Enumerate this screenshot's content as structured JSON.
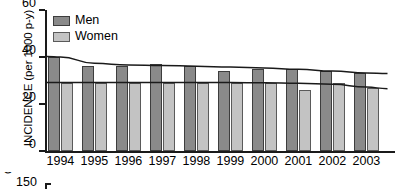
{
  "chart_data": {
    "type": "bar",
    "title": "",
    "xlabel": "",
    "ylabel": "INCIDENCE (per 1000 p-y)",
    "ylim": [
      0,
      60
    ],
    "yticks": [
      0,
      20,
      40,
      60
    ],
    "grid": false,
    "legend_position": "top-left",
    "categories": [
      "1994",
      "1995",
      "1996",
      "1997",
      "1998",
      "1999",
      "2000",
      "2001",
      "2002",
      "2003"
    ],
    "series": [
      {
        "name": "Men",
        "color": "#8a8a8a",
        "values": [
          40,
          36,
          36,
          37,
          36,
          34,
          35,
          35,
          34,
          33
        ]
      },
      {
        "name": "Women",
        "color": "#c3c3c3",
        "values": [
          29,
          29,
          29,
          29,
          29,
          29,
          29,
          26,
          29,
          27
        ]
      }
    ],
    "trend_lines": [
      {
        "name": "Men trend",
        "values": [
          40.0,
          37.3,
          36.6,
          36.4,
          36.1,
          35.7,
          35.3,
          34.8,
          34.0,
          33.2
        ]
      },
      {
        "name": "Women trend",
        "values": [
          29.2,
          29.2,
          29.2,
          29.2,
          29.2,
          29.1,
          29.0,
          28.8,
          28.4,
          27.2
        ]
      }
    ]
  },
  "legend": {
    "items": [
      {
        "label": "Men"
      },
      {
        "label": "Women"
      }
    ]
  },
  "axes": {
    "y_title": "INCIDENCE (per 1000 p-y)",
    "y_tick_labels": [
      "60",
      "40",
      "20",
      "0"
    ],
    "x_tick_labels": [
      "1994",
      "1995",
      "1996",
      "1997",
      "1998",
      "1999",
      "2000",
      "2001",
      "2002",
      "2003"
    ]
  },
  "next_panel": {
    "y_tick_label": "150",
    "partial_y_title": "C)"
  }
}
